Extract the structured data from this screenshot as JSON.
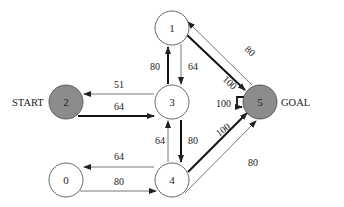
{
  "diagram": {
    "type": "state-transition-graph",
    "nodes": [
      {
        "id": "0",
        "label": "0",
        "cx": 66,
        "cy": 180,
        "filled": false
      },
      {
        "id": "1",
        "label": "1",
        "cx": 172,
        "cy": 28,
        "filled": false
      },
      {
        "id": "2",
        "label": "2",
        "cx": 66,
        "cy": 102,
        "filled": true
      },
      {
        "id": "3",
        "label": "3",
        "cx": 172,
        "cy": 102,
        "filled": false
      },
      {
        "id": "4",
        "label": "4",
        "cx": 172,
        "cy": 180,
        "filled": false
      },
      {
        "id": "5",
        "label": "5",
        "cx": 260,
        "cy": 102,
        "filled": true
      }
    ],
    "side_labels": {
      "start": "START",
      "goal": "GOAL"
    },
    "edges": [
      {
        "from": "3",
        "to": "2",
        "weight": "51",
        "bold": false
      },
      {
        "from": "2",
        "to": "3",
        "weight": "64",
        "bold": true
      },
      {
        "from": "3",
        "to": "1",
        "weight": "80",
        "bold": true
      },
      {
        "from": "1",
        "to": "3",
        "weight": "64",
        "bold": false
      },
      {
        "from": "1",
        "to": "5",
        "weight": "100",
        "bold": true
      },
      {
        "from": "5",
        "to": "1",
        "weight": "80",
        "bold": false
      },
      {
        "from": "5",
        "to": "5",
        "weight": "100",
        "bold": true
      },
      {
        "from": "3",
        "to": "4",
        "weight": "80",
        "bold": true
      },
      {
        "from": "4",
        "to": "3",
        "weight": "64",
        "bold": false
      },
      {
        "from": "4",
        "to": "0",
        "weight": "64",
        "bold": false
      },
      {
        "from": "0",
        "to": "4",
        "weight": "80",
        "bold": false
      },
      {
        "from": "4",
        "to": "5",
        "weight": "100",
        "bold": true
      },
      {
        "from": "4",
        "to": "5",
        "weight": "80",
        "bold": false
      }
    ],
    "colors": {
      "node_fill_special": "#8c8c8c",
      "node_fill": "#ffffff",
      "stroke": "#333333",
      "text": "#222222"
    }
  }
}
